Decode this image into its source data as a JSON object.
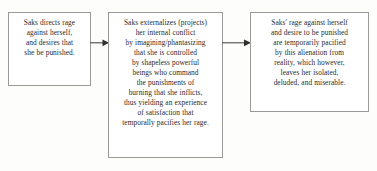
{
  "diagram": {
    "type": "flowchart",
    "orientation": "left-to-right",
    "background_color": "#fdfdfc",
    "box_border_color": "#9a9a98",
    "text_color": "#2b2b2b",
    "nodes": [
      {
        "id": "node-1",
        "name": "rage-directed-inward",
        "text": "Saks directs rage\nagainst herself,\nand desires that\nshe be punished.",
        "lines": [
          "Saks directs rage",
          "against herself,",
          "and desires that",
          "she be punished."
        ]
      },
      {
        "id": "node-2",
        "name": "externalization-projection",
        "text": "Saks externalizes (projects)\nher internal conflict\nby imagining/phantasizing\nthat she is controlled\nby shapeless powerful\nbeings who command\nthe punishments of\nburning that she inflicts,\nthus yielding an experience\nof satisfaction that\ntemporally pacifies her rage.",
        "lines": [
          "Saks externalizes (projects)",
          "her internal conflict",
          "by imagining/phantasizing",
          "that she is controlled",
          "by shapeless powerful",
          "beings who command",
          "the punishments of",
          "burning that she inflicts,",
          "thus yielding an experience",
          "of satisfaction that",
          "temporally pacifies her rage."
        ]
      },
      {
        "id": "node-3",
        "name": "temporary-pacification-outcome",
        "text": "Saks' rage against herself\nand desire to be punished\nare temporarily pacified\nby this alienation from\nreality, which however,\nleaves her isolated,\ndeluded, and miserable.",
        "lines": [
          "Saks' rage against herself",
          "and desire to be punished",
          "are temporarily pacified",
          "by this alienation from",
          "reality, which however,",
          "leaves her isolated,",
          "deluded, and miserable."
        ]
      }
    ],
    "connectors": [
      {
        "id": "arrow-1",
        "name": "arrow-node1-to-node2",
        "from": "node-1",
        "to": "node-2",
        "style": "solid-line-filled-arrowhead",
        "color": "#4a4a48"
      },
      {
        "id": "arrow-2",
        "name": "arrow-node2-to-node3",
        "from": "node-2",
        "to": "node-3",
        "style": "solid-line-filled-arrowhead",
        "color": "#4a4a48"
      }
    ]
  }
}
